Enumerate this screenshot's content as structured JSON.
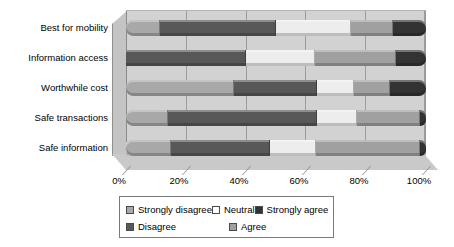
{
  "chart_data": {
    "type": "bar",
    "subtype": "horizontal-stacked-100",
    "title": "",
    "xlabel": "",
    "ylabel": "",
    "xlim": [
      0,
      100
    ],
    "xtick_labels": [
      "0%",
      "20%",
      "40%",
      "60%",
      "80%",
      "100%"
    ],
    "xticks": [
      0,
      20,
      40,
      60,
      80,
      100
    ],
    "grid": true,
    "legend_position": "bottom",
    "categories": [
      "Best for mobility",
      "Information access",
      "Worthwhile cost",
      "Safe transactions",
      "Safe information"
    ],
    "series": [
      {
        "name": "Strongly disagree",
        "color": "#a8a8a8",
        "values": [
          11,
          0,
          36,
          14,
          15
        ]
      },
      {
        "name": "Disagree",
        "color": "#585858",
        "values": [
          39,
          40,
          28,
          50,
          33
        ]
      },
      {
        "name": "Neutral",
        "color": "#ededed",
        "values": [
          25,
          23,
          12,
          13,
          15
        ]
      },
      {
        "name": "Agree",
        "color": "#a0a0a0",
        "values": [
          14,
          27,
          12,
          21,
          35
        ]
      },
      {
        "name": "Strongly agree",
        "color": "#333333",
        "values": [
          11,
          10,
          12,
          2,
          2
        ]
      }
    ]
  },
  "legend": {
    "items": [
      {
        "label": "Strongly disagree",
        "color": "#a8a8a8"
      },
      {
        "label": "Neutral",
        "color": "#ffffff"
      },
      {
        "label": "Strongly agree",
        "color": "#333333"
      },
      {
        "label": "Disagree",
        "color": "#585858"
      },
      {
        "label": "Agree",
        "color": "#a0a0a0"
      }
    ]
  }
}
